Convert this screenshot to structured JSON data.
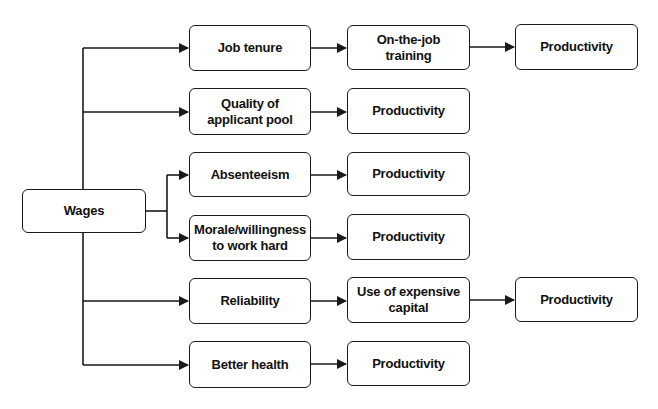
{
  "diagram": {
    "root": {
      "label": "Wages"
    },
    "branches": [
      {
        "label": "Job tenure",
        "steps": [
          "On-the-job\ntraining",
          "Productivity"
        ]
      },
      {
        "label": "Quality of\napplicant pool",
        "steps": [
          "Productivity"
        ]
      },
      {
        "label": "Absenteeism",
        "steps": [
          "Productivity"
        ]
      },
      {
        "label": "Morale/willingness\nto work hard",
        "steps": [
          "Productivity"
        ]
      },
      {
        "label": "Reliability",
        "steps": [
          "Use of expensive\ncapital",
          "Productivity"
        ]
      },
      {
        "label": "Better health",
        "steps": [
          "Productivity"
        ]
      }
    ],
    "colors": {
      "stroke": "#1a1a1a",
      "fill": "#ffffff",
      "text": "#111111"
    }
  }
}
